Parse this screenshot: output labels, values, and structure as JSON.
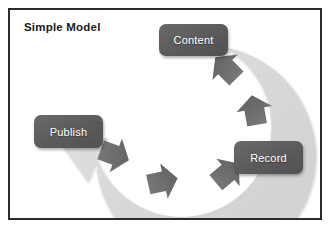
{
  "figure": {
    "title": "Simple Model",
    "type": "cycle-diagram",
    "border_color": "#2b2b2b",
    "background_color": "#ffffff"
  },
  "colors": {
    "node_fill": "#5e5e5e",
    "node_text": "#ffffff",
    "arc_band": "#d8d8d8",
    "chevron": "#6f6f6f",
    "title_text": "#1a1a1a"
  },
  "nodes": [
    {
      "id": "content",
      "label": "Content",
      "position": "top-right"
    },
    {
      "id": "record",
      "label": "Record",
      "position": "right-bottom"
    },
    {
      "id": "publish",
      "label": "Publish",
      "position": "left"
    }
  ],
  "flow": {
    "direction": "clockwise",
    "shape": "open-circular-arrow",
    "arrowhead": "large-arrowhead-pointing-to-publish",
    "chevron_count": 5,
    "sequence": [
      "Content",
      "Record",
      "Publish"
    ]
  }
}
